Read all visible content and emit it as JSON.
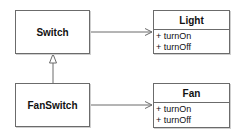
{
  "diagram": {
    "type": "UML class diagram",
    "classes": {
      "switch": {
        "name": "Switch"
      },
      "fanswitch": {
        "name": "FanSwitch"
      },
      "light": {
        "name": "Light",
        "operations": [
          "+ turnOn",
          "+ turnOff"
        ]
      },
      "fan": {
        "name": "Fan",
        "operations": [
          "+ turnOn",
          "+ turnOff"
        ]
      }
    },
    "relations": [
      {
        "from": "FanSwitch",
        "to": "Switch",
        "kind": "inheritance"
      },
      {
        "from": "Switch",
        "to": "Light",
        "kind": "association"
      },
      {
        "from": "FanSwitch",
        "to": "Fan",
        "kind": "association"
      }
    ],
    "colors": {
      "line": "#6b6b6b",
      "background": "#ffffff",
      "text": "#111111"
    }
  }
}
